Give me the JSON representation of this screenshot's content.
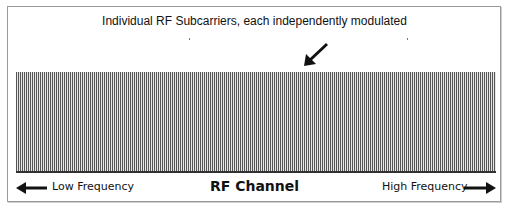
{
  "diagram": {
    "title": "Individual RF Subcarriers, each independently modulated",
    "channel_label": "RF Channel",
    "low_label": "Low Frequency",
    "high_label": "High Frequency",
    "icons": {
      "callout": "arrow-down-left-icon",
      "low": "arrow-left-icon",
      "high": "arrow-right-icon"
    },
    "colors": {
      "stripe_dark": "#555555",
      "stripe_light": "#e6e6e6",
      "text": "#111111",
      "frame": "#9a9a9a"
    },
    "subcarriers": {
      "count_approx": 240,
      "orientation": "vertical"
    }
  }
}
